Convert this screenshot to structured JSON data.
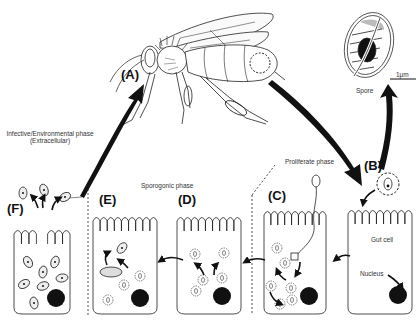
{
  "figure": {
    "stages": [
      {
        "id": "A",
        "label": "(A)"
      },
      {
        "id": "B",
        "label": "(B)"
      },
      {
        "id": "C",
        "label": "(C)"
      },
      {
        "id": "D",
        "label": "(D)"
      },
      {
        "id": "E",
        "label": "(E)"
      },
      {
        "id": "F",
        "label": "(F)"
      }
    ],
    "phases": {
      "infective_line1": "Infective/Environmental phase",
      "infective_line2": "(Extracellular)",
      "sporogonic": "Sporogonic phase",
      "proliferate": "Proliferate phase"
    },
    "annotations": {
      "spore": "Spore",
      "scale_bar": "1μm",
      "gut_cell": "Gut cell",
      "nucleus": "Nucleus"
    },
    "colors": {
      "ink": "#111111",
      "background": "#ffffff",
      "grey_fill": "#dddddd"
    }
  }
}
